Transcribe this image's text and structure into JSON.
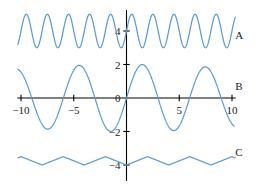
{
  "chart_data": {
    "type": "line",
    "title": "",
    "subtitle": "",
    "xlabel": "",
    "ylabel": "",
    "xlim": [
      -10.6,
      10.6
    ],
    "ylim": [
      -5.0,
      5.4
    ],
    "grid": false,
    "legend_position": "right-inline",
    "xticks": [
      -10,
      -5,
      5,
      10
    ],
    "xtick_labels": [
      "−10",
      "−5",
      "5",
      "10"
    ],
    "yticks": [
      4,
      2,
      0,
      -2,
      -4
    ],
    "ytick_labels": [
      "4",
      "2",
      "0",
      "−2",
      "−4"
    ],
    "line_color": "#5b9bd5",
    "axis_color": "#000000",
    "background_color": "#ffffff",
    "series": [
      {
        "name": "A",
        "label": "A",
        "label_x": 10.3,
        "label_y": 3.55,
        "color": "#5b9bd5",
        "description": "high-frequency sinusoid, period 2, amplitude 1, offset 4",
        "formula": "4 + sin(pi*x)",
        "baseline": 4,
        "amplitude": 1,
        "period": 2,
        "phase": 0
      },
      {
        "name": "B",
        "label": "B",
        "label_x": 10.3,
        "label_y": 0.45,
        "color": "#5b9bd5",
        "description": "beat / amplitude-modulated wave, large humps near x=-5, 2, 8, small ripples below zero between them",
        "formula": "sin(x) + sin(1.1*x)",
        "baseline": 0,
        "amplitude": 2,
        "period": 6.7,
        "phase": 0
      },
      {
        "name": "C",
        "label": "C",
        "label_x": 10.3,
        "label_y": -3.45,
        "color": "#5b9bd5",
        "description": "triangle wave, period 4, amplitude 0.5, centered at -3.5, minimum at x=0",
        "formula": "-3.5 - 0.5*tri(x)",
        "baseline": -3.5,
        "amplitude": 0.5,
        "period": 4,
        "phase": 0
      }
    ]
  },
  "figure": {
    "curve_labels": [
      "A",
      "B",
      "C"
    ]
  }
}
